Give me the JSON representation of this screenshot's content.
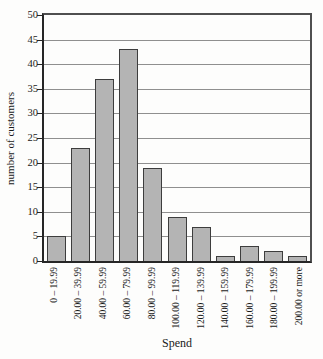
{
  "chart_data": {
    "type": "bar",
    "title": "",
    "xlabel": "Spend",
    "ylabel": "number of customers",
    "categories": [
      "0 – 19.99",
      "20.00 – 39.99",
      "40.00 – 59.99",
      "60.00 – 79.99",
      "80.00 – 99.99",
      "100.00 – 119.99",
      "120.00 – 139.99",
      "140.00 – 159.99",
      "160.00 – 179.99",
      "180.00 – 199.99",
      "200.00 or more"
    ],
    "values": [
      5,
      23,
      37,
      43,
      19,
      9,
      7,
      1,
      3,
      2,
      1
    ],
    "ylim": [
      0,
      50
    ],
    "ytick_step": 5,
    "grid": true,
    "legend": null,
    "colors": {
      "bar_fill": "#b4b4b4",
      "bar_border": "#3d3d3d",
      "gridline": "#8f8f8f",
      "axis": "#262626",
      "background": "#fdfdfc"
    }
  }
}
